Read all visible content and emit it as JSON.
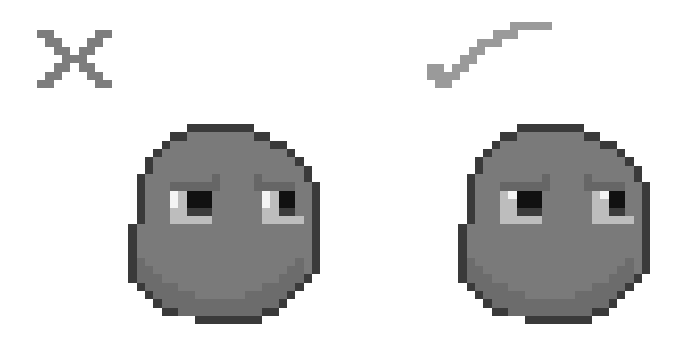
{
  "scene": {
    "title": "Pixel face comparison",
    "background": "#ffffff",
    "width": 694,
    "height": 364
  },
  "palette": {
    "O": "#3a3a3a",
    "D": "#5e5e5e",
    "M": "#7a7a7a",
    "S": "#6c6c6c",
    "B": "#666666",
    "P": "#111111",
    "R": "#3c3c3c",
    "W": "#f4f4f4",
    "L": "#bdbdbd",
    "G": "#8e8e8e",
    "I": "#858585"
  },
  "icons": {
    "wrong": {
      "label": "incorrect",
      "symbol": "cross",
      "color": "#7d7d7d",
      "x": 37,
      "y": 30,
      "px": 8.3,
      "grid": [
        "XX.....XX",
        ".XX...XX.",
        "..XX.XX..",
        "...XXX...",
        "..XX.XX..",
        ".XX...XX.",
        "XX.....XX"
      ]
    },
    "right": {
      "label": "correct",
      "symbol": "checkmark",
      "color": "#9a9a9a",
      "x": 427,
      "y": 22,
      "px": 8.3,
      "grid": [
        "..........XXXXX",
        "........XXX....",
        "......XXX......",
        ".....XX........",
        "....XX.........",
        "XX.XX..........",
        "XXXX...........",
        ".XX............"
      ]
    }
  },
  "faces": [
    {
      "label": "face with tall eye highlight",
      "verdict": "incorrect",
      "x": 120,
      "y": 124,
      "px": 8.35,
      "grid": [
        "........OOOOOOOO........",
        "......OOMMMMMMMMOO......",
        ".....OMMMMMMMMMMMMOO....",
        "....OMMMMMMMMMMMMMMMO...",
        "...OMMMMMMMMMMMMMMMMMO..",
        "...OMMMMMMMMMMMMMMMMMMO.",
        "..OMMMMMMMMBMMMMBMMMMMO.",
        "..OMMMBBBBBBMMMMBBBBBMMO",
        "..OMMMWLPPPMMMMMMWLPPMMO",
        "..OMMMWLPPPMMMMMMWLPPMMO",
        "..OMMMLLRRRMMMMMMLLRRMMO",
        "..OMMMLLLLLMMMMMMLLLLLMO",
        ".OMMMMMMMMMMMMMMMMMMMMMO",
        ".OMMMMMMMMMMMMMMMMMMMMMO",
        ".OMMMMMMMMMMMMMMMMMMMMMO",
        ".OMMMMMMMMMMMMMMMMMMMMMO",
        ".OSMMMMMMMMMMMMMMMMMMSMO",
        ".OSSMMMMMMMMMMMMMMMMSSMO",
        ".OSSSMMMMMMMMMMMMMMSSSO.",
        "..OSSSSMMMMMMMMMMSSSSO..",
        "...OSSSSSMMMMMMSSSSSO...",
        "....OSSSSSSSSSSSSSSO....",
        ".....OOSSSSSSSSSSOO.....",
        ".........OOOOOOOO......."
      ]
    },
    {
      "label": "face with small eye highlight",
      "verdict": "correct",
      "x": 450,
      "y": 124,
      "px": 8.35,
      "grid": [
        "........OOOOOOOO........",
        "......OOMMMMMMMMOO......",
        ".....OMMMMMMMMMMMMOO....",
        "....OMMMMMMMMMMMMMMMO...",
        "...OMMMMMMMMMMMMMMMMMO..",
        "...OMMMMMMMMMMMMMMMMMMO.",
        "..OMMMMMMMMBMMMMBMMMMMO.",
        "..OMMMBBBBBBMMMMBBBBBMMO",
        "..OMMMLWPPPMMMMMMLWPPMMO",
        "..OMMMLLPPPMMMMMMLLPPMMO",
        "..OMMMLLRRRMMMMMMLLRRMMO",
        "..OMMMLLLLLMMMMMMLLLLLMO",
        ".OMMMMMMMMMMMMMMMMMMMMMO",
        ".OMMMMMMMMMMMMMMMMMMMMMO",
        ".OMMMMMMMMMMMMMMMMMMMMMO",
        ".OMMMMMMMMMMMMMMMMMMMMMO",
        ".OSMMMMMMMMMMMMMMMMMMSMO",
        ".OSSMMMMMMMMMMMMMMMMSSMO",
        ".OSSSMMMMMMMMMMMMMMSSSO.",
        "..OSSSSMMMMMMMMMMSSSSO..",
        "...OSSSSSMMMMMMSSSSSO...",
        "....OSSSSSSSSSSSSSSO....",
        ".....OOSSSSSSSSSSOO.....",
        ".........OOOOOOOO......."
      ]
    }
  ]
}
